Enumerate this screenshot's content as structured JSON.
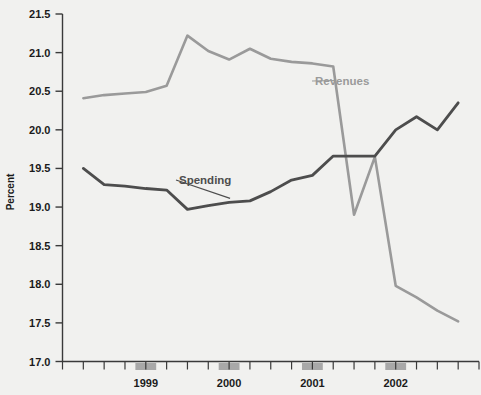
{
  "chart_data": {
    "type": "line",
    "title": "",
    "subtitle": "",
    "xlabel": "",
    "ylabel": "Percent",
    "ylim": [
      17.0,
      21.5
    ],
    "ytick_labels": [
      "21.5",
      "21.0",
      "20.5",
      "20.0",
      "19.5",
      "19.0",
      "18.5",
      "18.0",
      "17.5",
      "17.0"
    ],
    "ytick_values": [
      21.5,
      21.0,
      20.5,
      20.0,
      19.5,
      19.0,
      18.5,
      18.0,
      17.5,
      17.0
    ],
    "xtick_labels": [
      "1999",
      "2000",
      "2001",
      "2002"
    ],
    "xtick_label_values": [
      1999,
      2000,
      2001,
      2002
    ],
    "x": [
      1998.25,
      1998.5,
      1998.75,
      1999.0,
      1999.25,
      1999.5,
      1999.75,
      2000.0,
      2000.25,
      2000.5,
      2000.75,
      2001.0,
      2001.25,
      2001.5,
      2001.75,
      2002.0,
      2002.25,
      2002.5,
      2002.75
    ],
    "grid": false,
    "legend": "inline-annotations",
    "shaded_year_bars": [
      1999,
      2000,
      2001,
      2002
    ],
    "series": [
      {
        "name": "Revenues",
        "color": "#9a9a9a",
        "annotation": "Revenues",
        "values": [
          20.41,
          20.45,
          20.47,
          20.49,
          20.57,
          21.22,
          21.02,
          20.91,
          21.05,
          20.92,
          20.88,
          20.86,
          20.82,
          18.9,
          19.65,
          17.98,
          17.83,
          17.66,
          17.52
        ]
      },
      {
        "name": "Spending",
        "color": "#4d4d4d",
        "annotation": "Spending",
        "values": [
          19.5,
          19.29,
          19.27,
          19.24,
          19.22,
          18.97,
          19.02,
          19.06,
          19.08,
          19.2,
          19.35,
          19.41,
          19.66,
          19.66,
          19.66,
          20.0,
          20.17,
          20.0,
          20.35
        ]
      }
    ]
  },
  "axis": {
    "y_title": "Percent"
  },
  "annotations": {
    "revenues_label": "Revenues",
    "spending_label": "Spending"
  },
  "colors": {
    "background": "#f1f1ef",
    "revenues": "#9a9a9a",
    "spending": "#4d4d4d",
    "axis": "#3a3a3a",
    "shaded_bar": "#a8a8a8"
  }
}
